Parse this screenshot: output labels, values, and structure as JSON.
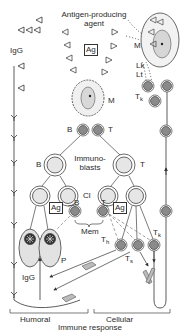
{
  "title": {
    "line1": "Antigen-producing",
    "line2": "agent"
  },
  "labels": {
    "ag_top": "Ag",
    "ag_left": "Ag",
    "ag_right": "Ag",
    "m_top_right": "M",
    "m_center": "M",
    "lk": "Lk",
    "lt": "Lt",
    "tk_top": "T",
    "tk_top_sub": "k",
    "igg_top": "IgG",
    "igg_bottom": "IgG",
    "b_upper": "B",
    "t_upper": "T",
    "b_blast": "B",
    "t_blast": "T",
    "immunoblasts_line1": "Immuno-",
    "immunoblasts_line2": "blasts",
    "cl": "Cl",
    "b_mem": "B",
    "t_mem": "T",
    "mem": "Mem",
    "th": "T",
    "th_sub": "h",
    "ts": "T",
    "ts_sub": "s",
    "tk_bottom": "T",
    "tk_bottom_sub": "k",
    "p": "P"
  },
  "footer": {
    "humoral": "Humoral",
    "cellular": "Cellular",
    "immune_response": "Immune response"
  },
  "colors": {
    "line": "#333333",
    "cell_fill": "#e6e6e6",
    "dark_nucleus": "#8a8a8a",
    "plasma_fill": "#e2e2e2"
  }
}
